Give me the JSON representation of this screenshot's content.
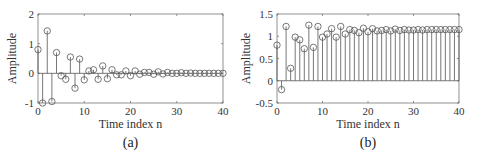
{
  "chart_data": [
    {
      "type": "stem",
      "panel": "a",
      "caption": "(a)",
      "xlabel": "Time index n",
      "ylabel": "Amplitude",
      "xlim": [
        0,
        40
      ],
      "ylim": [
        -1,
        2
      ],
      "xticks": [
        0,
        10,
        20,
        30,
        40
      ],
      "yticks": [
        -1,
        0,
        1,
        2
      ],
      "x": [
        0,
        1,
        2,
        3,
        4,
        5,
        6,
        7,
        8,
        9,
        10,
        11,
        12,
        13,
        14,
        15,
        16,
        17,
        18,
        19,
        20,
        21,
        22,
        23,
        24,
        25,
        26,
        27,
        28,
        29,
        30,
        31,
        32,
        33,
        34,
        35,
        36,
        37,
        38,
        39,
        40
      ],
      "values": [
        0.8,
        -1.0,
        1.43,
        -0.95,
        0.7,
        -0.08,
        -0.2,
        0.55,
        -0.5,
        0.48,
        -0.22,
        0.08,
        0.12,
        -0.2,
        0.25,
        -0.18,
        0.12,
        -0.05,
        -0.05,
        0.08,
        -0.08,
        0.08,
        -0.03,
        0.03,
        0.03,
        -0.03,
        0.05,
        -0.02,
        0.03,
        0.0,
        0.0,
        0.02,
        0.0,
        0.01,
        0.0,
        0.0,
        0.0,
        0.0,
        0.0,
        0.0,
        0.0
      ]
    },
    {
      "type": "stem",
      "panel": "b",
      "caption": "(b)",
      "xlabel": "Time index n",
      "ylabel": "Amplitude",
      "xlim": [
        0,
        40
      ],
      "ylim": [
        -0.5,
        1.5
      ],
      "xticks": [
        0,
        10,
        20,
        30,
        40
      ],
      "yticks": [
        -0.5,
        0,
        0.5,
        1,
        1.5
      ],
      "x": [
        0,
        1,
        2,
        3,
        4,
        5,
        6,
        7,
        8,
        9,
        10,
        11,
        12,
        13,
        14,
        15,
        16,
        17,
        18,
        19,
        20,
        21,
        22,
        23,
        24,
        25,
        26,
        27,
        28,
        29,
        30,
        31,
        32,
        33,
        34,
        35,
        36,
        37,
        38,
        39,
        40
      ],
      "values": [
        0.8,
        -0.2,
        1.22,
        0.28,
        0.98,
        0.92,
        0.72,
        1.25,
        0.75,
        1.22,
        0.98,
        1.05,
        1.17,
        0.98,
        1.22,
        1.05,
        1.15,
        1.13,
        1.08,
        1.18,
        1.1,
        1.17,
        1.12,
        1.13,
        1.15,
        1.12,
        1.16,
        1.13,
        1.15,
        1.14,
        1.14,
        1.15,
        1.14,
        1.15,
        1.15,
        1.15,
        1.15,
        1.15,
        1.15,
        1.15,
        1.15
      ]
    }
  ],
  "layout": {
    "panels": [
      {
        "left": 38,
        "right": 223,
        "top": 14,
        "bottom": 103
      },
      {
        "left": 277,
        "right": 459,
        "top": 14,
        "bottom": 103
      }
    ],
    "stem_color": "#555555",
    "axis_color": "#777777",
    "marker_radius": 3.2
  }
}
